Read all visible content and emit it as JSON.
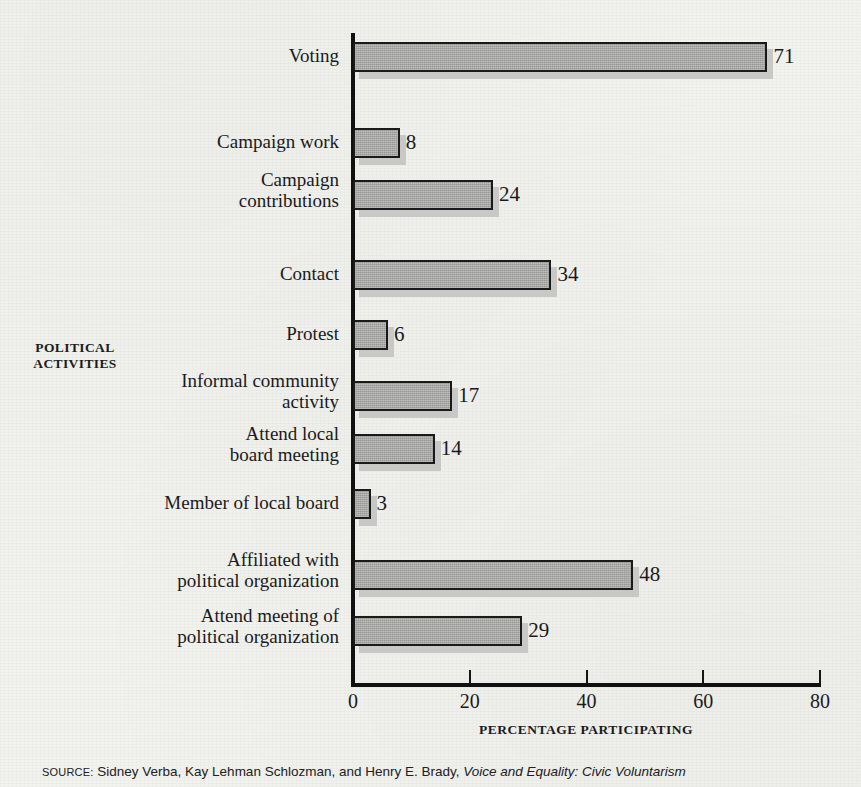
{
  "chart_data": {
    "type": "bar",
    "orientation": "horizontal",
    "title": "",
    "xlabel": "PERCENTAGE PARTICIPATING",
    "ylabel": "POLITICAL ACTIVITIES",
    "xlim": [
      0,
      80
    ],
    "xticks": [
      0,
      20,
      40,
      60,
      80
    ],
    "xtick_labels": [
      "0",
      "20",
      "40",
      "60",
      "80"
    ],
    "grid": false,
    "legend": false,
    "categories": [
      "Voting",
      "Campaign work",
      "Campaign contributions",
      "Contact",
      "Protest",
      "Informal community activity",
      "Attend local board meeting",
      "Member of local board",
      "Affiliated with political organization",
      "Attend meeting of political organization"
    ],
    "values": [
      71,
      8,
      24,
      34,
      6,
      17,
      14,
      3,
      48,
      29
    ],
    "value_labels": [
      "71",
      "8",
      "24",
      "34",
      "6",
      "17",
      "14",
      "3",
      "48",
      "29"
    ],
    "bar_color": "#a3a3a1",
    "bar_edge_color": "#1a1a1a",
    "shadow_color": "#c8c8c6",
    "axis_color": "#111111",
    "background_color": "#f2f2ef"
  },
  "rows": [
    {
      "label_line1": "Voting",
      "label_line2": "",
      "value": 71,
      "value_label": "71",
      "top": 42
    },
    {
      "label_line1": "Campaign work",
      "label_line2": "",
      "value": 8,
      "value_label": "8",
      "top": 128
    },
    {
      "label_line1": "Campaign",
      "label_line2": "contributions",
      "value": 24,
      "value_label": "24",
      "top": 180
    },
    {
      "label_line1": "Contact",
      "label_line2": "",
      "value": 34,
      "value_label": "34",
      "top": 260
    },
    {
      "label_line1": "Protest",
      "label_line2": "",
      "value": 6,
      "value_label": "6",
      "top": 320
    },
    {
      "label_line1": "Informal community",
      "label_line2": "activity",
      "value": 17,
      "value_label": "17",
      "top": 381
    },
    {
      "label_line1": "Attend local",
      "label_line2": "board meeting",
      "value": 14,
      "value_label": "14",
      "top": 434
    },
    {
      "label_line1": "Member of local board",
      "label_line2": "",
      "value": 3,
      "value_label": "3",
      "top": 489
    },
    {
      "label_line1": "Affiliated with",
      "label_line2": "political organization",
      "value": 48,
      "value_label": "48",
      "top": 560
    },
    {
      "label_line1": "Attend meeting of",
      "label_line2": "political organization",
      "value": 29,
      "value_label": "29",
      "top": 616
    }
  ],
  "axis": {
    "y_label_line1": "POLITICAL",
    "y_label_line2": "ACTIVITIES",
    "x_title": "PERCENTAGE PARTICIPATING",
    "ticks": [
      {
        "label": "0",
        "value": 0
      },
      {
        "label": "20",
        "value": 20
      },
      {
        "label": "40",
        "value": 40
      },
      {
        "label": "60",
        "value": 60
      },
      {
        "label": "80",
        "value": 80
      }
    ]
  },
  "source": {
    "kicker": "SOURCE:",
    "authors": " Sidney Verba, Kay Lehman Schlozman, and Henry E. Brady, ",
    "title": "Voice and Equality: Civic Voluntarism"
  }
}
